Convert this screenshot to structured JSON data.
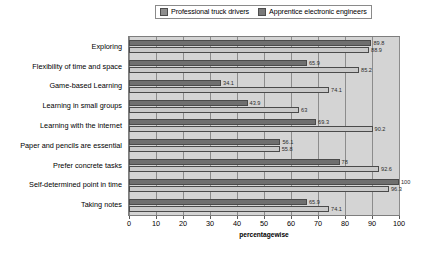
{
  "chart_data": {
    "type": "bar",
    "orientation": "horizontal",
    "title": "",
    "xlabel": "percentagewise",
    "ylabel": "",
    "xlim": [
      0,
      100
    ],
    "xticks": [
      "0",
      "10",
      "20",
      "30",
      "40",
      "50",
      "60",
      "70",
      "80",
      "90",
      "100"
    ],
    "grid": true,
    "legend_position": "top",
    "categories": [
      "Exploring",
      "Flexibility of time and space",
      "Game-based Learning",
      "Learning in small groups",
      "Learning with the internet",
      "Paper and pencils are essential",
      "Prefer concrete tasks",
      "Self-determined point in time",
      "Taking notes"
    ],
    "series": [
      {
        "name": "Professional truck drivers",
        "color": "#6f6f6f",
        "values": [
          89.8,
          65.9,
          34.1,
          43.9,
          69.3,
          56.1,
          78,
          100,
          65.9
        ],
        "labels": [
          "89.8",
          "65.9",
          "34.1",
          "43.9",
          "69.3",
          "56.1",
          "78",
          "100",
          "65.9"
        ]
      },
      {
        "name": "Apprentice electronic engineers",
        "color": "#c9c9c9",
        "values": [
          88.9,
          85.2,
          74.1,
          63,
          90.2,
          55.8,
          92.6,
          96.3,
          74.1
        ],
        "labels": [
          "88.9",
          "85.2",
          "74.1",
          "63",
          "90.2",
          "55.8",
          "92.6",
          "96.3",
          "74.1"
        ]
      }
    ]
  }
}
